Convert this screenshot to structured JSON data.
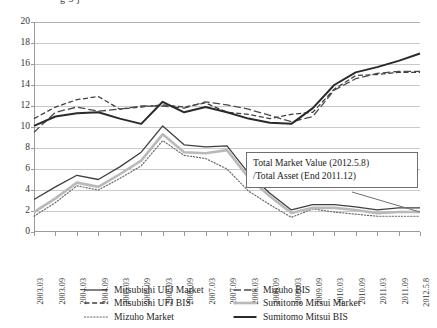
{
  "top_caption": "g 5 j",
  "annotation": {
    "line1": "Total Market Value (2012.5.8)",
    "line2": "/Total Asset (End 2011.12)"
  },
  "legend": {
    "left": [
      {
        "label": "Mitsubishi UFJ Market",
        "style": "solid",
        "color": "#3f3f3f",
        "width": 1.3
      },
      {
        "label": "Mitsubishi UFJ BIS",
        "style": "dashed",
        "color": "#3f3f3f",
        "width": 1.3
      },
      {
        "label": "Mizuho Market",
        "style": "dotted",
        "color": "#6b6b6b",
        "width": 1.2
      }
    ],
    "right": [
      {
        "label": "Mizuho BIS",
        "style": "longdash",
        "color": "#4a4a4a",
        "width": 1.3
      },
      {
        "label": "Sumitomo Mitsui Market",
        "style": "solid",
        "color": "#b9b9b9",
        "width": 2.6
      },
      {
        "label": "Sumitomo Mitsui BIS",
        "style": "solid",
        "color": "#2a2a2a",
        "width": 2.0
      }
    ]
  },
  "chart_data": {
    "type": "line",
    "title": "",
    "xlabel": "",
    "ylabel": "",
    "ylim": [
      0,
      20
    ],
    "ytick_step": 2,
    "yticks": [
      0,
      2,
      4,
      6,
      8,
      10,
      12,
      14,
      16,
      18,
      20
    ],
    "grid": true,
    "legend_position": "bottom",
    "categories": [
      "2003.03",
      "2003.09",
      "2004.03",
      "2004.09",
      "2005.03",
      "2005.09",
      "2006.03",
      "2006.09",
      "2007.03",
      "2007.09",
      "2008.03",
      "2008.09",
      "2009.03",
      "2009.09",
      "2010.03",
      "2010.09",
      "2011.03",
      "2011.09",
      "2012.5.8"
    ],
    "series": [
      {
        "name": "Mitsubishi UFJ Market",
        "style": "solid",
        "color": "#3f3f3f",
        "width": 1.3,
        "values": [
          3.1,
          4.3,
          5.4,
          5.0,
          6.2,
          7.6,
          10.1,
          8.3,
          8.1,
          8.2,
          5.6,
          3.7,
          2.1,
          2.6,
          2.6,
          2.4,
          2.1,
          2.3,
          2.3
        ]
      },
      {
        "name": "Mitsubishi UFJ BIS",
        "style": "dashed",
        "color": "#3f3f3f",
        "width": 1.3,
        "values": [
          10.8,
          11.9,
          12.6,
          12.9,
          11.7,
          11.9,
          12.1,
          11.9,
          12.3,
          11.4,
          11.2,
          10.8,
          11.2,
          11.4,
          13.6,
          14.9,
          15.0,
          15.2,
          15.2
        ]
      },
      {
        "name": "Mizuho Market",
        "style": "dotted",
        "color": "#6b6b6b",
        "width": 1.2,
        "values": [
          1.5,
          2.8,
          4.4,
          4.0,
          5.1,
          6.3,
          8.7,
          7.3,
          7.0,
          6.0,
          3.9,
          2.6,
          1.4,
          2.2,
          1.9,
          1.7,
          1.5,
          1.5,
          1.5
        ]
      },
      {
        "name": "Mizuho BIS",
        "style": "longdash",
        "color": "#4a4a4a",
        "width": 1.3,
        "values": [
          9.5,
          11.4,
          11.9,
          11.5,
          11.7,
          12.0,
          12.0,
          11.8,
          12.4,
          12.1,
          11.7,
          11.1,
          10.5,
          11.0,
          13.5,
          14.6,
          15.1,
          15.3,
          15.3
        ]
      },
      {
        "name": "Sumitomo Mitsui Market",
        "style": "solid",
        "color": "#b9b9b9",
        "width": 2.6,
        "values": [
          1.9,
          3.2,
          4.7,
          4.3,
          5.5,
          6.8,
          9.3,
          7.6,
          7.5,
          7.8,
          5.2,
          3.4,
          1.8,
          2.3,
          2.3,
          2.1,
          1.8,
          1.9,
          1.9
        ]
      },
      {
        "name": "Sumitomo Mitsui BIS",
        "style": "solid",
        "color": "#2a2a2a",
        "width": 2.0,
        "values": [
          10.1,
          11.0,
          11.3,
          11.4,
          10.8,
          10.3,
          12.4,
          11.4,
          11.9,
          11.4,
          10.8,
          10.4,
          10.3,
          11.8,
          14.0,
          15.2,
          15.7,
          16.3,
          17.0
        ]
      }
    ],
    "annotation_note": "Total Market Value (2012.5.8) /Total Asset (End 2011.12)",
    "annotation_target_series": "Sumitomo Mitsui Market",
    "annotation_target_index": 18
  }
}
